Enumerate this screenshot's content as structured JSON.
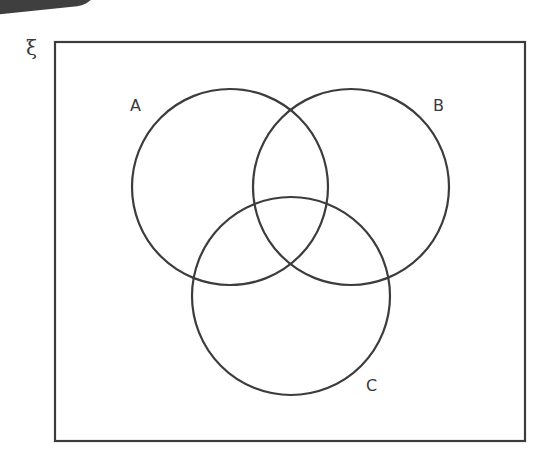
{
  "diagram": {
    "type": "venn",
    "universal_set_symbol": "ξ",
    "universal_rect": {
      "x": 55,
      "y": 42,
      "width": 470,
      "height": 399
    },
    "stroke_color": "#3c3c3c",
    "sets": [
      {
        "label": "A",
        "cx": 230,
        "cy": 187,
        "r": 98,
        "label_x": 130,
        "label_y": 98
      },
      {
        "label": "B",
        "cx": 351,
        "cy": 187,
        "r": 98,
        "label_x": 433,
        "label_y": 98
      },
      {
        "label": "C",
        "cx": 291,
        "cy": 296,
        "r": 99,
        "label_x": 366,
        "label_y": 378
      }
    ]
  }
}
